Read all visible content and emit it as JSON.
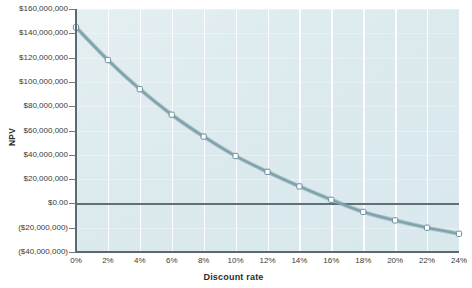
{
  "chart_data": {
    "type": "line",
    "title": "",
    "xlabel": "Discount rate",
    "ylabel": "NPV",
    "x": [
      0,
      2,
      4,
      6,
      8,
      10,
      12,
      14,
      16,
      18,
      20,
      22,
      24
    ],
    "x_tick_labels": [
      "0%",
      "2%",
      "4%",
      "6%",
      "8%",
      "10%",
      "12%",
      "14%",
      "16%",
      "18%",
      "20%",
      "22%",
      "24%"
    ],
    "xlim": [
      0,
      24
    ],
    "y_tick_values": [
      160000000,
      140000000,
      120000000,
      100000000,
      80000000,
      60000000,
      40000000,
      20000000,
      0,
      -20000000,
      -40000000
    ],
    "y_tick_labels": [
      "$160,000,000",
      "$140,000,000",
      "$120,000,000",
      "$100,000,000",
      "$80,000,000",
      "$60,000,000",
      "$40,000,000",
      "$20,000,000",
      "$0.00",
      "($20,000,000)",
      "($40,000,000)"
    ],
    "ylim": [
      -40000000,
      160000000
    ],
    "grid": "vertical-white-gridlines",
    "legend": "none",
    "zero_line": 0,
    "series": [
      {
        "name": "NPV",
        "values": [
          145000000,
          118000000,
          94000000,
          73000000,
          55000000,
          39000000,
          26000000,
          14000000,
          3000000,
          -7000000,
          -14000000,
          -20000000,
          -25000000
        ],
        "line_color": "#7fa3ad",
        "marker_color": "#ffffff",
        "marker_edge_color": "#6b8f99",
        "marker": "square"
      }
    ],
    "plot_background": "#dcebef",
    "axis_color": "#5a6a70"
  }
}
